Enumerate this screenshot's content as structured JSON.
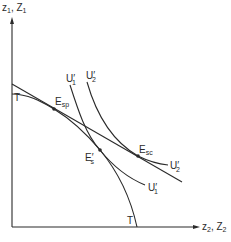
{
  "diagram": {
    "type": "economics-production-possibility-indifference",
    "axes": {
      "y_label": {
        "main": "z",
        "main_sub": "1",
        "sep": ", ",
        "alt": "Z",
        "alt_sub": "1"
      },
      "x_label": {
        "main": "z",
        "main_sub": "2",
        "sep": ", ",
        "alt": "Z",
        "alt_sub": "2"
      }
    },
    "curves": {
      "transformation": {
        "label": "T"
      },
      "price_line": {
        "label": ""
      },
      "indifference_1": {
        "label": "U",
        "prime": "′",
        "sub": "1"
      },
      "indifference_2": {
        "label": "U",
        "prime": "′",
        "sub": "2"
      }
    },
    "points": {
      "e_sp": {
        "label": "E",
        "sub": "sp"
      },
      "e_s_prime": {
        "label": "E",
        "prime": "′",
        "sub": "s"
      },
      "e_sc": {
        "label": "E",
        "sub": "sc"
      }
    },
    "colors": {
      "ink": "#2a2a2a",
      "background": "#ffffff"
    }
  }
}
